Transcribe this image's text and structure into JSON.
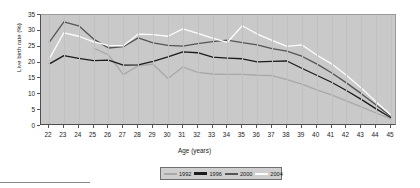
{
  "chart_data": {
    "type": "line",
    "title": "",
    "xlabel": "Age (years)",
    "ylabel": "Live birth rate (%)",
    "xlim": [
      22,
      45
    ],
    "ylim": [
      0,
      35
    ],
    "grid": true,
    "legend_position": "bottom",
    "categories": [
      22,
      23,
      24,
      25,
      26,
      27,
      28,
      29,
      30,
      31,
      32,
      33,
      34,
      35,
      36,
      37,
      38,
      39,
      40,
      41,
      42,
      43,
      44,
      45
    ],
    "x_tick_labels": [
      "22",
      "23",
      "24",
      "25",
      "26",
      "27",
      "28",
      "29",
      "30",
      "31",
      "32",
      "33",
      "34",
      "35",
      "36",
      "37",
      "38",
      "39",
      "40",
      "41",
      "42",
      "43",
      "44",
      "45"
    ],
    "y_tick_labels": [
      "0",
      "5",
      "10",
      "15",
      "20",
      "25",
      "30",
      "35"
    ],
    "y_ticks": [
      0,
      5,
      10,
      15,
      20,
      25,
      30,
      35
    ],
    "series": [
      {
        "name": "1992",
        "color": "#a8a8a8",
        "values": [
          null,
          null,
          null,
          24.6,
          22.4,
          16.2,
          19.0,
          19.5,
          15.0,
          18.6,
          16.9,
          16.4,
          16.3,
          16.3,
          16.0,
          15.9,
          14.6,
          13.2,
          11.4,
          9.8,
          7.9,
          6.0,
          4.1,
          2.2
        ]
      },
      {
        "name": "1996",
        "color": "#1c1c1c",
        "values": [
          19.5,
          22.2,
          21.3,
          20.6,
          20.8,
          19.2,
          19.3,
          20.4,
          21.8,
          23.4,
          23.1,
          21.7,
          21.4,
          21.2,
          20.2,
          20.4,
          20.5,
          18.2,
          16.0,
          13.8,
          11.2,
          8.4,
          5.4,
          2.6
        ]
      },
      {
        "name": "2000",
        "color": "#555555",
        "values": [
          26.3,
          32.8,
          31.6,
          27.4,
          24.6,
          25.0,
          27.8,
          26.2,
          25.4,
          25.2,
          26.0,
          26.6,
          27.1,
          26.3,
          25.6,
          24.4,
          23.6,
          22.0,
          19.6,
          16.8,
          13.6,
          10.2,
          6.6,
          3.0
        ]
      },
      {
        "name": "2004",
        "color": "#fdfdfd",
        "values": [
          21.0,
          29.4,
          28.3,
          26.5,
          25.4,
          25.3,
          29.0,
          28.8,
          28.3,
          30.6,
          29.2,
          27.7,
          26.4,
          31.6,
          29.0,
          27.0,
          25.1,
          25.6,
          22.4,
          19.6,
          16.0,
          12.0,
          7.6,
          3.4
        ]
      }
    ]
  },
  "legend": {
    "entries": [
      {
        "label": "1992"
      },
      {
        "label": "1996"
      },
      {
        "label": "2000"
      },
      {
        "label": "2004"
      }
    ]
  }
}
